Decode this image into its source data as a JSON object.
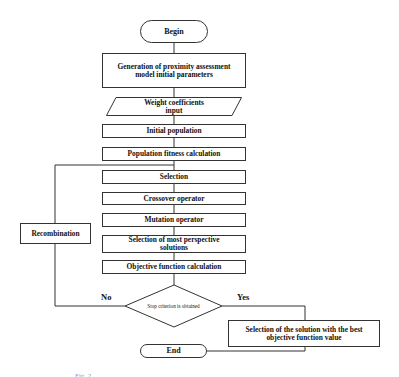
{
  "diagram": {
    "type": "flowchart",
    "nodes": {
      "begin": "Begin",
      "generation_line1": "Generation of proximity assessment",
      "generation_line2": "model initial parameters",
      "weight_line1": "Weight coefficients",
      "weight_line2": "input",
      "initial_population": "Initial population",
      "fitness": "Population fitness calculation",
      "selection": "Selection",
      "crossover": "Crossover operator",
      "mutation": "Mutation operator",
      "most_perspective_line1": "Selection of most perspective",
      "most_perspective_line2": "solutions",
      "objective": "Objective function calculation",
      "decision": "Stop criterion is obtained",
      "recombination": "Recombination",
      "best_solution_line1": "Selection of the solution with the best",
      "best_solution_line2": "objective function value",
      "end": "End"
    },
    "edge_labels": {
      "no": "No",
      "yes": "Yes"
    },
    "edges": [
      [
        "Begin",
        "Generation of proximity assessment model initial parameters"
      ],
      [
        "Generation of proximity assessment model initial parameters",
        "Weight coefficients input"
      ],
      [
        "Weight coefficients input",
        "Initial population"
      ],
      [
        "Initial population",
        "Population fitness calculation"
      ],
      [
        "Population fitness calculation",
        "Selection"
      ],
      [
        "Selection",
        "Crossover operator"
      ],
      [
        "Crossover operator",
        "Mutation operator"
      ],
      [
        "Mutation operator",
        "Selection of most perspective solutions"
      ],
      [
        "Selection of most perspective solutions",
        "Objective function calculation"
      ],
      [
        "Objective function calculation",
        "Stop criterion is obtained"
      ],
      [
        "Stop criterion is obtained",
        "Recombination",
        "No"
      ],
      [
        "Recombination",
        "Selection"
      ],
      [
        "Stop criterion is obtained",
        "Selection of the solution with the best objective function value",
        "Yes"
      ],
      [
        "Selection of the solution with the best objective function value",
        "End"
      ]
    ],
    "caption": "Fig. 2."
  }
}
